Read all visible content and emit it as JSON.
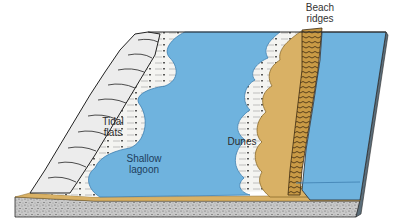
{
  "diagram": {
    "type": "block-diagram",
    "colors": {
      "water": "#6fb3de",
      "water_edge": "#3d7fb0",
      "sand": "#d9b165",
      "sand_dark": "#8a6a2a",
      "flats": "#f3f3f0",
      "bedrock": "#bdbdbd",
      "outline": "#2a2a2a"
    },
    "labels": {
      "beach_ridges": "Beach\nridges",
      "tidal_flats": "Tidal\nflats",
      "shallow_lagoon": "Shallow\nlagoon",
      "dunes": "Dunes"
    }
  }
}
